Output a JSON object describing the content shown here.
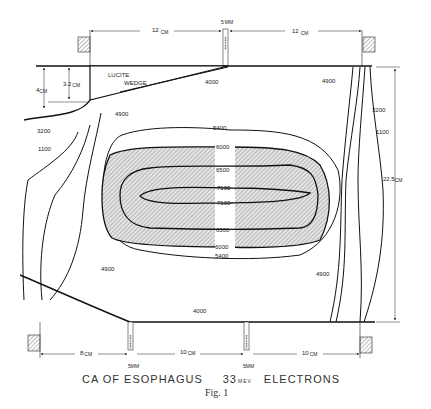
{
  "figure": {
    "caption": {
      "left": "CA OF ESOPHAGUS",
      "energy_value": "33",
      "energy_unit": "MEV",
      "right": "ELECTRONS"
    },
    "fig_label": "Fig. 1"
  },
  "dimensions": {
    "top_left_width": "12",
    "top_right_width": "12",
    "top_unit": "CM",
    "top_gap": "5",
    "top_gap_unit": "MM",
    "wedge_height": "3.2",
    "wedge_height_unit": "CM",
    "left_height": "4",
    "left_height_unit": "CM",
    "right_height": "22.5",
    "right_height_unit": "CM",
    "bottom_left": "8",
    "bottom_middle": "10",
    "bottom_right": "10",
    "bottom_unit": "CM",
    "bottom_gap_1": "5",
    "bottom_gap_2": "5",
    "bottom_gap_unit": "MM"
  },
  "wedge": {
    "line1": "LUCITE",
    "line2": "WEDGE"
  },
  "isodose_labels": {
    "top_center": "4000",
    "top_right": "4900",
    "left_outer": "3200",
    "left_inner": "1100",
    "left_upper": "4900",
    "right_outer": "3200",
    "right_inner": "1100",
    "c5400_top": "5400",
    "c6000_top": "6000",
    "c6500_top": "6500",
    "c7100_top": "7100",
    "c7100_bottom": "7100",
    "c6500_bottom": "6500",
    "c6000_bottom": "6000",
    "c5400_bottom": "5400",
    "lower_left": "4900",
    "lower_right": "4900",
    "bottom_center": "4000"
  }
}
